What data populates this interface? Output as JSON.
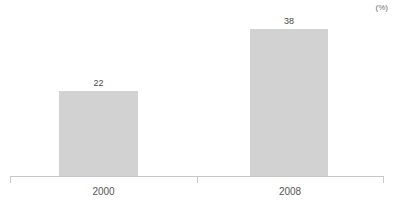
{
  "chart_data": {
    "type": "bar",
    "title": "",
    "subtitle": "",
    "xlabel": "",
    "ylabel": "",
    "unit_label": "(%)",
    "categories": [
      "2000",
      "2008"
    ],
    "values": [
      22,
      38
    ],
    "data_labels": [
      "22",
      "38"
    ],
    "ylim": [
      0,
      45.6
    ],
    "grid": false,
    "legend": false,
    "legend_position": "none",
    "axis": {
      "baseline_visible": true,
      "ticks": [
        "left",
        "middle",
        "right"
      ],
      "tick_count": 3
    },
    "colors": {
      "bar_fill": "#d2d2d2",
      "axis_line": "#c8c8c8",
      "value_label_text": "#4a4a4a",
      "category_label_text": "#555555",
      "unit_label_text": "#6e6e6e",
      "background": "#ffffff"
    }
  }
}
